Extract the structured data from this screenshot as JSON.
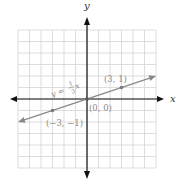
{
  "chart_data": {
    "type": "line",
    "title": "",
    "xlabel": "x",
    "ylabel": "y",
    "xlim": [
      -7,
      7
    ],
    "ylim": [
      -7,
      7
    ],
    "grid": true,
    "grid_range": {
      "x": [
        -6,
        6
      ],
      "y": [
        -6,
        6
      ]
    },
    "series": [
      {
        "name": "y = 1/3 x",
        "equation_label": "y = ⅓x",
        "slope": 0.3333,
        "intercept": 0,
        "x": [
          -6,
          6
        ],
        "y": [
          -2,
          2
        ],
        "color": "#8a8a8a"
      }
    ],
    "points": [
      {
        "x": 3,
        "y": 1,
        "label": "(3, 1)"
      },
      {
        "x": 0,
        "y": 0,
        "label": "(0, 0)"
      },
      {
        "x": -3,
        "y": -1,
        "label": "(−3, −1)"
      }
    ],
    "legend": null
  },
  "labels": {
    "x_axis": "x",
    "y_axis": "y",
    "equation_prefix": "y =",
    "equation_num": "1",
    "equation_den": "3",
    "equation_var": "x",
    "point_a": "(3, 1)",
    "point_origin": "(0, 0)",
    "point_b": "(−3, −1)",
    "corner_mark": "2."
  },
  "colors": {
    "axis": "#111111",
    "grid": "#d4d4d4",
    "line": "#8a8a8a",
    "label": "#8a8a8a"
  }
}
